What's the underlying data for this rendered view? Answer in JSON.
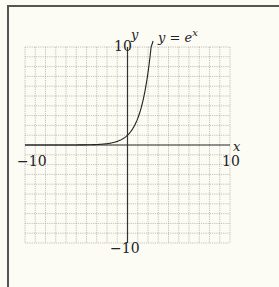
{
  "chart_data": {
    "type": "line",
    "title": "",
    "series": [
      {
        "name": "y = e^x",
        "function": "exp(x)",
        "x": [
          -10,
          -5,
          -3,
          -2,
          -1,
          0,
          0.5,
          1,
          1.5,
          2,
          2.3026
        ],
        "y": [
          4.54e-05,
          0.0067,
          0.0498,
          0.1353,
          0.3679,
          1,
          1.6487,
          2.7183,
          4.4817,
          7.3891,
          10
        ]
      }
    ],
    "xlabel": "x",
    "ylabel": "y",
    "xlim": [
      -10,
      10
    ],
    "ylim": [
      -10,
      10
    ],
    "grid": true,
    "grid_step": 1,
    "tick_labels": {
      "x": [
        "-10",
        "10"
      ],
      "y": [
        "10",
        "-10"
      ]
    },
    "annotations": [
      "y = e^x"
    ]
  },
  "labels": {
    "xmin": "−10",
    "xmax": "10",
    "ymax": "10",
    "ymin": "−10",
    "xaxis": "x",
    "yaxis": "y",
    "curve_label_y": "y = e",
    "curve_label_sup": "x"
  }
}
